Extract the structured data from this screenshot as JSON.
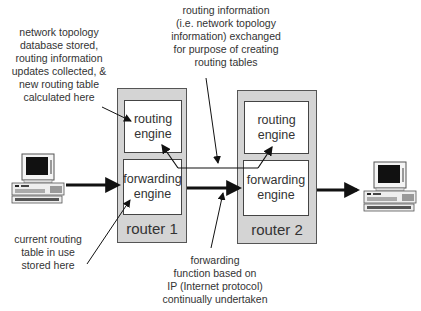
{
  "annotations": {
    "top_left": [
      "network topology",
      "database stored,",
      "routing information",
      "updates collected, &",
      "new routing table",
      "calculated here"
    ],
    "top_center": [
      "routing information",
      "(i.e. network topology",
      "information) exchanged",
      "for purpose of creating",
      "routing tables"
    ],
    "bottom_left": [
      "current routing",
      "table in use",
      "stored here"
    ],
    "bottom_center": [
      "forwarding",
      "function based on",
      "IP (Internet protocol)",
      "continually undertaken"
    ]
  },
  "routers": [
    {
      "label": "router 1",
      "routing_engine": [
        "routing",
        "engine"
      ],
      "forwarding_engine": [
        "forwarding",
        "engine"
      ]
    },
    {
      "label": "router 2",
      "routing_engine": [
        "routing",
        "engine"
      ],
      "forwarding_engine": [
        "forwarding",
        "engine"
      ]
    }
  ],
  "hosts": [
    {
      "icon": "desktop-computer-icon",
      "position": "left"
    },
    {
      "icon": "desktop-computer-icon",
      "position": "right"
    }
  ],
  "colors": {
    "router_fill": "#d4d4d4",
    "engine_fill": "#ffffff",
    "stroke": "#222222"
  }
}
